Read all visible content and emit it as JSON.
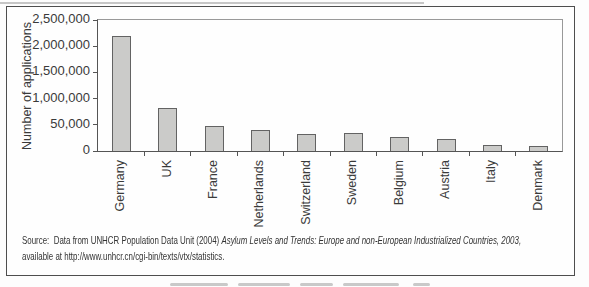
{
  "chart_data": {
    "type": "bar",
    "title": "",
    "xlabel": "",
    "ylabel": "Number of applications",
    "categories": [
      "Germany",
      "UK",
      "France",
      "Netherlands",
      "Switzerland",
      "Sweden",
      "Belgium",
      "Austria",
      "Italy",
      "Denmark"
    ],
    "values": [
      2200000,
      830000,
      470000,
      410000,
      330000,
      345000,
      265000,
      220000,
      105000,
      95000
    ],
    "ylim": [
      0,
      2500000
    ],
    "y_tick_labels": [
      "2,500,000",
      "2,000,000",
      "1,500,000",
      "1,000,000",
      "50,000",
      "0"
    ],
    "grid": "off",
    "legend": "none",
    "bar_color": "#cbcbc9",
    "bar_border_color": "#636363",
    "axis_color": "#555555"
  },
  "source": {
    "prefix": "Source:  Data from UNHCR Population Data Unit (2004) ",
    "italic_title": "Asylum Levels and Trends: Europe and non-European Industrialized Countries, 2003,",
    "line2": "available at http://www.unhcr.cn/cgi-bin/texts/vtx/statistics."
  }
}
